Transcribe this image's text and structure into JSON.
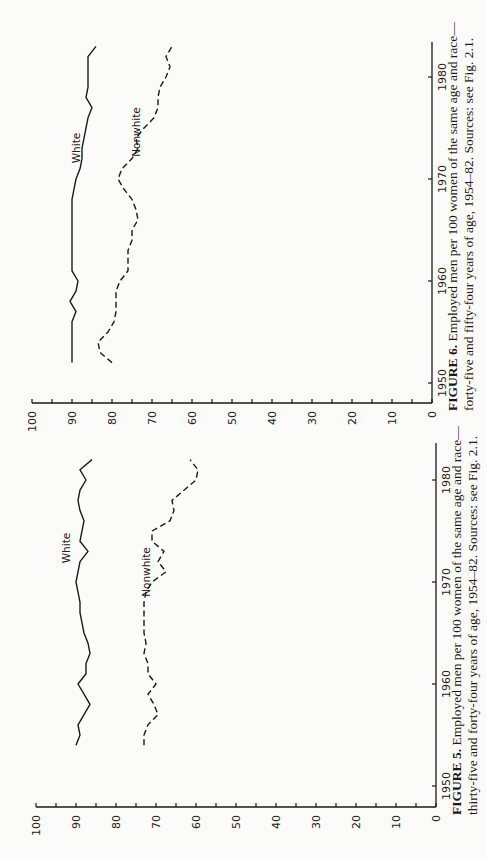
{
  "chart_data": [
    {
      "id": "figure-6",
      "type": "line",
      "title": "FIGURE 6. Employed men per 100 women of the same age and race—forty-five and fifty-four years of age, 1954–82. Sources: see Fig. 2.1.",
      "figure_label": "FIGURE 6.",
      "caption_line1_rest": "Employed men per 100 women of the same age and race—",
      "caption_line2": "forty-five and fifty-four years of age, 1954–82. Sources: see Fig. 2.1.",
      "xlabel": "",
      "ylabel": "",
      "xlim": [
        1950,
        1983
      ],
      "ylim": [
        0,
        100
      ],
      "x_ticks": [
        1950,
        1960,
        1970,
        1980
      ],
      "y_ticks": [
        0,
        10,
        20,
        30,
        40,
        50,
        60,
        70,
        80,
        90,
        100
      ],
      "grid": false,
      "legend": "inline labels",
      "orientation": "rotated 90° counter-clockwise on page",
      "series": [
        {
          "name": "White",
          "style": "solid",
          "x": [
            1952,
            1953,
            1954,
            1955,
            1956,
            1957,
            1958,
            1959,
            1960,
            1961,
            1962,
            1963,
            1964,
            1965,
            1966,
            1967,
            1968,
            1969,
            1970,
            1971,
            1972,
            1973,
            1974,
            1975,
            1976,
            1977,
            1978,
            1979,
            1980,
            1981,
            1982,
            1983
          ],
          "values": [
            90,
            90,
            90,
            90,
            90,
            89,
            90.5,
            89,
            88.5,
            90,
            90,
            90,
            90,
            90,
            90,
            90,
            90,
            89.5,
            89,
            88,
            87.5,
            87.5,
            87,
            86.5,
            86,
            85,
            86.5,
            86,
            86,
            86,
            86,
            84
          ]
        },
        {
          "name": "Nonwhite",
          "style": "dashed",
          "x": [
            1952,
            1953,
            1954,
            1955,
            1956,
            1957,
            1958,
            1959,
            1960,
            1961,
            1962,
            1963,
            1964,
            1965,
            1966,
            1967,
            1968,
            1969,
            1970,
            1971,
            1972,
            1973,
            1974,
            1975,
            1976,
            1977,
            1978,
            1979,
            1980,
            1981,
            1982,
            1983
          ],
          "values": [
            80,
            83,
            83.5,
            81,
            79.5,
            79,
            79,
            79,
            78,
            76,
            76,
            76,
            75,
            75,
            73.5,
            74,
            75,
            77,
            78.5,
            77.5,
            75,
            73.5,
            74,
            72,
            69.5,
            68.5,
            68.5,
            68,
            66.5,
            65.5,
            66.5,
            65
          ]
        }
      ]
    },
    {
      "id": "figure-5",
      "type": "line",
      "title": "FIGURE 5. Employed men per 100 women of the same age and race—thirty-five and forty-four years of age, 1954–82. Sources: see Fig. 2.1.",
      "figure_label": "FIGURE 5.",
      "caption_line1_rest": "Employed men per 100 women of the same age and race—",
      "caption_line2": "thirty-five and forty-four years of age, 1954–82. Sources: see Fig. 2.1.",
      "xlabel": "",
      "ylabel": "",
      "xlim": [
        1950,
        1983
      ],
      "ylim": [
        0,
        100
      ],
      "x_ticks": [
        1950,
        1960,
        1970,
        1980
      ],
      "y_ticks": [
        0,
        10,
        20,
        30,
        40,
        50,
        60,
        70,
        80,
        90,
        100
      ],
      "grid": false,
      "legend": "inline labels",
      "orientation": "rotated 90° counter-clockwise on page",
      "series": [
        {
          "name": "White",
          "style": "solid",
          "x": [
            1954,
            1955,
            1956,
            1957,
            1958,
            1959,
            1960,
            1961,
            1962,
            1963,
            1964,
            1965,
            1966,
            1967,
            1968,
            1969,
            1970,
            1971,
            1972,
            1973,
            1974,
            1975,
            1976,
            1977,
            1978,
            1979,
            1980,
            1981,
            1982
          ],
          "values": [
            90,
            89,
            89.5,
            88,
            86.5,
            88,
            89.5,
            87.5,
            87.5,
            86.5,
            87,
            88,
            88.5,
            89,
            89,
            89.5,
            90,
            89.5,
            89,
            87,
            89,
            88.5,
            88,
            89,
            89.5,
            89,
            87.5,
            89,
            86
          ]
        },
        {
          "name": "Nonwhite",
          "style": "dashed",
          "x": [
            1954,
            1955,
            1956,
            1957,
            1958,
            1959,
            1960,
            1961,
            1962,
            1963,
            1964,
            1965,
            1966,
            1967,
            1968,
            1969,
            1970,
            1971,
            1972,
            1973,
            1974,
            1975,
            1976,
            1977,
            1978,
            1979,
            1980,
            1981,
            1982
          ],
          "values": [
            73,
            73,
            72,
            69.5,
            70.5,
            72,
            70,
            72,
            72,
            73,
            72.5,
            73,
            73,
            73,
            73,
            72.5,
            71,
            67.5,
            69.5,
            68,
            71,
            71,
            66.5,
            65.5,
            66,
            63,
            60,
            59.5,
            61.5
          ]
        }
      ]
    }
  ]
}
